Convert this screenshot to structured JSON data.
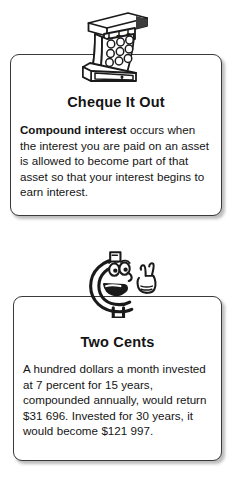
{
  "page": {
    "background_color": "#ffffff",
    "width": 234,
    "height": 483
  },
  "cards": [
    {
      "id": "cheque-it-out",
      "title": "Cheque It Out",
      "body_lead": "Compound interest",
      "body_rest": " occurs when the interest you are paid on an asset is allowed to become part of that asset so that your interest begins to earn interest.",
      "illustration": {
        "name": "cash-register-icon",
        "label": "ABC",
        "description": "cash register with keypad and drawer"
      }
    },
    {
      "id": "two-cents",
      "title": "Two Cents",
      "body_rest": "A hundred dollars a month invested at 7 percent for 15 years, compounded annually, would return $31 696. Invested for 30 years, it would become $121 997.",
      "illustration": {
        "name": "cent-character-icon",
        "description": "smiling cent sign character making a two-finger V sign"
      },
      "figures": {
        "monthly_investment": "A hundred dollars a month",
        "rate": "7 percent",
        "term_short": "15 years",
        "term_long": "30 years",
        "return_short": "$31 696",
        "return_long": "$121 997",
        "compounding": "annually"
      }
    }
  ],
  "style": {
    "ink": "#141414",
    "card_border": "#3a3a3a",
    "card_fill": "#ffffff",
    "shadow": "rgba(90,90,90,0.40)"
  }
}
